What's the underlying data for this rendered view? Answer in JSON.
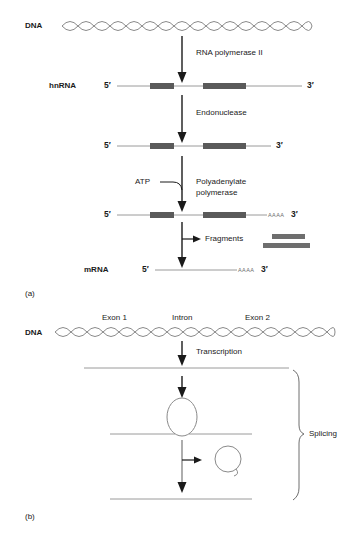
{
  "figure": {
    "background": "#ffffff",
    "line_color": "#8a8a8a",
    "arrow_color": "#1a1a1a",
    "box_color": "#5a5a5a",
    "text_color": "#1a1a1a"
  },
  "panel_a": {
    "id": "(a)",
    "dna_label": "DNA",
    "step1_label": "RNA polymerase II",
    "hnrna_label": "hnRNA",
    "hnrna_five": "5′",
    "hnrna_three": "3′",
    "step2_label": "Endonuclease",
    "row2_five": "5′",
    "row2_three": "3′",
    "atp_label": "ATP",
    "step3_label_line1": "Polyadenylate",
    "step3_label_line2": "polymerase",
    "row3_five": "5′",
    "row3_three": "3′",
    "row3_tail": "AAAA",
    "fragments_label": "Fragments",
    "mrna_label": "mRNA",
    "mrna_five": "5′",
    "mrna_three": "3′",
    "mrna_tail": "AAAA"
  },
  "panel_b": {
    "id": "(b)",
    "dna_label": "DNA",
    "exon1_label": "Exon 1",
    "intron_label": "Intron",
    "exon2_label": "Exon 2",
    "transcription_label": "Transcription",
    "splicing_label": "Splicing"
  }
}
